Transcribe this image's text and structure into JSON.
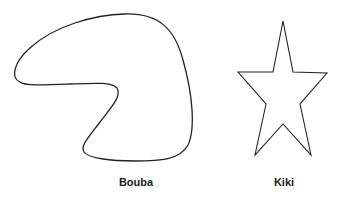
{
  "figures": [
    {
      "name": "bouba",
      "label": "Bouba",
      "shape": "rounded-blob"
    },
    {
      "name": "kiki",
      "label": "Kiki",
      "shape": "spiky-star"
    }
  ],
  "colors": {
    "stroke": "#222222",
    "background": "#ffffff"
  }
}
